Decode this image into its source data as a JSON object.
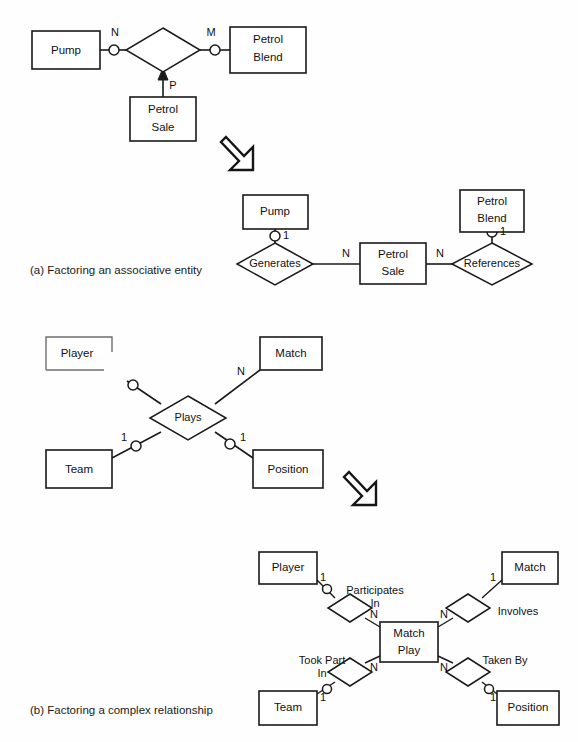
{
  "figure": {
    "background": "#fefefe",
    "ink_color": "#1a1a1a",
    "parts": [
      {
        "id": "a",
        "caption": "(a) Factoring an associative entity",
        "caption_pos": {
          "x": 30,
          "y": 271
        }
      },
      {
        "id": "b",
        "caption": "(b) Factoring a complex relationship",
        "caption_pos": {
          "x": 30,
          "y": 711
        }
      }
    ]
  },
  "diagram_a_before": {
    "title": "Associative entity (before factoring)",
    "entities": [
      {
        "name": "Pump",
        "lines": [
          "Pump"
        ],
        "x": 32,
        "y": 31,
        "w": 68,
        "h": 38
      },
      {
        "name": "Petrol Blend",
        "lines": [
          "Petrol",
          "Blend"
        ],
        "x": 230,
        "y": 27,
        "w": 76,
        "h": 46
      },
      {
        "name": "Petrol Sale",
        "lines": [
          "Petrol",
          "Sale"
        ],
        "x": 130,
        "y": 97,
        "w": 66,
        "h": 44
      }
    ],
    "relationship": {
      "name": "",
      "label": "",
      "cx": 163,
      "cy": 50,
      "rx": 37,
      "ry": 22
    },
    "connectors": [
      {
        "from": "Pump",
        "to": "relationship",
        "cardinality": "N",
        "optional_marker": true
      },
      {
        "from": "relationship",
        "to": "Petrol Blend",
        "cardinality": "M",
        "optional_marker": true
      },
      {
        "from": "Petrol Sale",
        "to": "relationship",
        "cardinality": "P",
        "arrow": true
      }
    ],
    "cardinality_labels": [
      {
        "text": "N",
        "x": 115,
        "y": 33
      },
      {
        "text": "M",
        "x": 210,
        "y": 33
      },
      {
        "text": "P",
        "x": 172,
        "y": 85
      }
    ]
  },
  "diagram_a_after": {
    "title": "Associative entity (after factoring)",
    "entities": [
      {
        "name": "Pump",
        "lines": [
          "Pump"
        ],
        "x": 243,
        "y": 195,
        "w": 65,
        "h": 34
      },
      {
        "name": "Petrol Blend",
        "lines": [
          "Petrol",
          "Blend"
        ],
        "x": 460,
        "y": 190,
        "w": 64,
        "h": 42
      },
      {
        "name": "Petrol Sale",
        "lines": [
          "Petrol",
          "Sale"
        ],
        "x": 360,
        "y": 243,
        "w": 66,
        "h": 41
      }
    ],
    "relationships": [
      {
        "name": "Generates",
        "label": "Generates",
        "cx": 275,
        "cy": 264,
        "rx": 38,
        "ry": 21
      },
      {
        "name": "References",
        "label": "References",
        "cx": 492,
        "cy": 264,
        "rx": 40,
        "ry": 21
      }
    ],
    "cardinality_labels": [
      {
        "text": "1",
        "x": 285,
        "y": 237
      },
      {
        "text": "1",
        "x": 502,
        "y": 232
      },
      {
        "text": "N",
        "x": 345,
        "y": 255
      },
      {
        "text": "N",
        "x": 440,
        "y": 255
      }
    ],
    "optional_markers": [
      {
        "x": 275,
        "y": 237
      },
      {
        "x": 492,
        "y": 232
      }
    ]
  },
  "diagram_b_before": {
    "title": "Complex relationship (before factoring)",
    "entities": [
      {
        "name": "Player",
        "lines": [
          "Player"
        ],
        "x": 46,
        "y": 337,
        "w": 66,
        "h": 33,
        "broken": true
      },
      {
        "name": "Match",
        "lines": [
          "Match"
        ],
        "x": 260,
        "y": 337,
        "w": 62,
        "h": 33
      },
      {
        "name": "Team",
        "lines": [
          "Team"
        ],
        "x": 46,
        "y": 450,
        "w": 66,
        "h": 38
      },
      {
        "name": "Position",
        "lines": [
          "Position"
        ],
        "x": 253,
        "y": 450,
        "w": 70,
        "h": 38
      }
    ],
    "relationship": {
      "name": "Plays",
      "label": "Plays",
      "cx": 188,
      "cy": 418,
      "rx": 38,
      "ry": 22
    },
    "cardinality_labels": [
      {
        "text": "N",
        "x": 240,
        "y": 371
      },
      {
        "text": "1",
        "x": 124,
        "y": 446
      },
      {
        "text": "1",
        "x": 248,
        "y": 446
      }
    ],
    "optional_markers": [
      {
        "x": 134,
        "y": 386
      },
      {
        "x": 136,
        "y": 452
      },
      {
        "x": 231,
        "y": 450
      }
    ]
  },
  "diagram_b_after": {
    "title": "Complex relationship (after factoring)",
    "entities": [
      {
        "name": "Player",
        "lines": [
          "Player"
        ],
        "x": 259,
        "y": 552,
        "w": 58,
        "h": 32
      },
      {
        "name": "Match",
        "lines": [
          "Match"
        ],
        "x": 502,
        "y": 552,
        "w": 56,
        "h": 32
      },
      {
        "name": "Team",
        "lines": [
          "Team"
        ],
        "x": 259,
        "y": 691,
        "w": 58,
        "h": 34
      },
      {
        "name": "Position",
        "lines": [
          "Position"
        ],
        "x": 497,
        "y": 691,
        "w": 62,
        "h": 34
      },
      {
        "name": "Match Play",
        "lines": [
          "Match",
          "Play"
        ],
        "x": 380,
        "y": 622,
        "w": 58,
        "h": 40
      }
    ],
    "relationships": [
      {
        "name": "Participates In",
        "label_lines": [
          "Participates",
          "In"
        ],
        "cx": 350,
        "cy": 608,
        "rx": 22,
        "ry": 14,
        "label_x": 374,
        "label_y": 591
      },
      {
        "name": "Involves",
        "label_lines": [
          "Involves"
        ],
        "cx": 468,
        "cy": 608,
        "rx": 22,
        "ry": 14,
        "label_x": 512,
        "label_y": 612
      },
      {
        "name": "Took Part In",
        "label_lines": [
          "Took Part",
          "In"
        ],
        "cx": 350,
        "cy": 672,
        "rx": 22,
        "ry": 14,
        "label_x": 322,
        "label_y": 662
      },
      {
        "name": "Taken By",
        "label_lines": [
          "Taken By"
        ],
        "cx": 468,
        "cy": 672,
        "rx": 22,
        "ry": 14,
        "label_x": 499,
        "label_y": 661
      }
    ],
    "cardinality_labels": [
      {
        "text": "1",
        "x": 322,
        "y": 580
      },
      {
        "text": "1",
        "x": 489,
        "y": 579
      },
      {
        "text": "1",
        "x": 322,
        "y": 690
      },
      {
        "text": "1",
        "x": 490,
        "y": 690
      },
      {
        "text": "N",
        "x": 375,
        "y": 618
      },
      {
        "text": "N",
        "x": 444,
        "y": 618
      },
      {
        "text": "N",
        "x": 375,
        "y": 665
      },
      {
        "text": "N",
        "x": 444,
        "y": 665
      }
    ],
    "optional_markers": [
      {
        "x": 328,
        "y": 587
      },
      {
        "x": 328,
        "y": 693
      },
      {
        "x": 488,
        "y": 693
      }
    ]
  },
  "transition_arrows": [
    {
      "name": "transition-arrow-a",
      "x": 222,
      "y": 134,
      "size": 46
    },
    {
      "name": "transition-arrow-b",
      "x": 344,
      "y": 468,
      "size": 46
    }
  ]
}
